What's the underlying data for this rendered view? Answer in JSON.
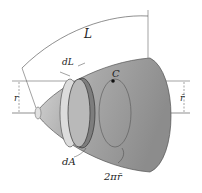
{
  "figure": {
    "type": "surface-of-revolution",
    "labels": {
      "length": "L",
      "arc_element": "dL",
      "centroid": "C",
      "radius_left": "r",
      "radius_right": "r̄",
      "area_element": "dA",
      "circumference": "2πr̄"
    },
    "colors": {
      "surface_light": "#cfcfcf",
      "surface_mid": "#a9a9a9",
      "surface_dark": "#8a8a8a",
      "band": "#7d7d7d",
      "line": "#333333"
    }
  }
}
